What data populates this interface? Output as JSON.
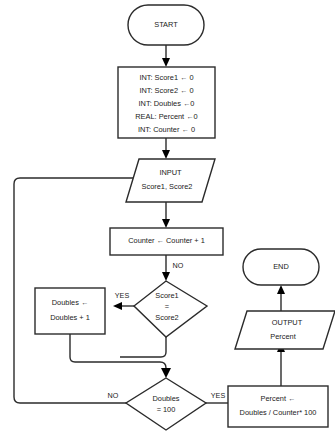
{
  "diagram": {
    "colors": {
      "background": "#ffffff",
      "stroke": "#2b2b2b",
      "text": "#1a1a1a",
      "arrow_fill": "#000000"
    }
  },
  "nodes": {
    "start": {
      "shape": "terminator",
      "label": "START"
    },
    "declare": {
      "shape": "process",
      "lines": [
        "INT: Score1 ← 0",
        "INT: Score2 ← 0",
        "INT: Doubles ←0",
        "REAL: Percent ←0",
        "INT: Counter ← 0"
      ]
    },
    "input": {
      "shape": "parallelogram",
      "lines": [
        "INPUT",
        "Score1, Score2"
      ]
    },
    "counter": {
      "shape": "process",
      "lines": [
        "Counter ← Counter + 1"
      ]
    },
    "compare": {
      "shape": "decision",
      "lines": [
        "Score1",
        "=",
        "Score2"
      ]
    },
    "doubles": {
      "shape": "process",
      "lines": [
        "Doubles ←",
        "Doubles + 1"
      ]
    },
    "check_hundred": {
      "shape": "decision",
      "lines": [
        "Doubles",
        "= 100"
      ]
    },
    "percent": {
      "shape": "process",
      "lines": [
        "Percent ←",
        "Doubles / Counter* 100"
      ]
    },
    "output": {
      "shape": "parallelogram",
      "lines": [
        "OUTPUT",
        "Percent"
      ]
    },
    "end": {
      "shape": "terminator",
      "label": "END"
    }
  },
  "branch_labels": {
    "compare_no": "NO",
    "compare_yes": "YES",
    "hundred_no": "NO",
    "hundred_yes": "YES"
  }
}
